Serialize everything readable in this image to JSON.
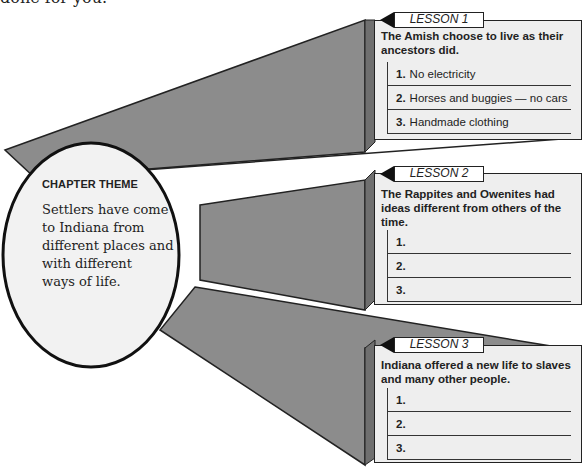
{
  "intro_text": "done for you.",
  "colors": {
    "connector_fill": "#8c8c8c",
    "box_fill": "#eeeeee",
    "circle_fill": "#f2f2f2",
    "stroke": "#222222"
  },
  "chapter_theme": {
    "heading": "CHAPTER THEME",
    "lines": [
      "Settlers have come",
      "to Indiana from",
      "different places and",
      "with different",
      "ways of life."
    ]
  },
  "lessons": [
    {
      "tab": "LESSON 1",
      "lead": [
        "The Amish choose to live as their",
        "ancestors did."
      ],
      "items": [
        {
          "num": "1.",
          "text": "No electricity"
        },
        {
          "num": "2.",
          "text": "Horses and buggies — no cars"
        },
        {
          "num": "3.",
          "text": "Handmade clothing"
        }
      ]
    },
    {
      "tab": "LESSON 2",
      "lead": [
        "The Rappites and Owenites had",
        "ideas different from others of the",
        "time."
      ],
      "items": [
        {
          "num": "1.",
          "text": ""
        },
        {
          "num": "2.",
          "text": ""
        },
        {
          "num": "3.",
          "text": ""
        }
      ]
    },
    {
      "tab": "LESSON 3",
      "lead": [
        "Indiana offered a new life to slaves",
        "and many other people."
      ],
      "items": [
        {
          "num": "1.",
          "text": ""
        },
        {
          "num": "2.",
          "text": ""
        },
        {
          "num": "3.",
          "text": ""
        }
      ]
    }
  ]
}
